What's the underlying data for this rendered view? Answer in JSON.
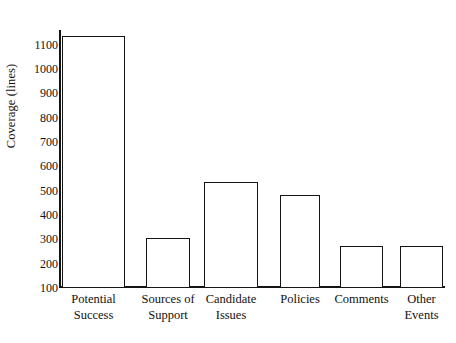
{
  "chart_data": {
    "type": "bar",
    "title": "",
    "subtitle": "",
    "xlabel": "",
    "ylabel": "Coverage (lines)",
    "categories": [
      "Potential Success",
      "Sources of Support",
      "Candidate Issues",
      "Policies",
      "Comments",
      "Other Events"
    ],
    "category_lines": [
      [
        "Potential",
        "Success"
      ],
      [
        "Sources of",
        "Support"
      ],
      [
        "Candidate",
        "Issues"
      ],
      [
        "Policies",
        ""
      ],
      [
        "Comments",
        ""
      ],
      [
        "Other",
        "Events"
      ]
    ],
    "values": [
      1130,
      300,
      530,
      480,
      270,
      270
    ],
    "ylim": [
      100,
      1160
    ],
    "yticks": [
      100,
      200,
      300,
      400,
      500,
      600,
      700,
      800,
      900,
      1000,
      1100
    ],
    "ytick_labels": [
      "100",
      "200",
      "300",
      "400",
      "500",
      "600",
      "700",
      "800",
      "900",
      "1000",
      "1100"
    ],
    "grid": false,
    "legend": null,
    "bar_style": {
      "fill": "#ffffff",
      "outline": "#141414"
    },
    "axis_color": "#141414",
    "background": "#ffffff"
  }
}
